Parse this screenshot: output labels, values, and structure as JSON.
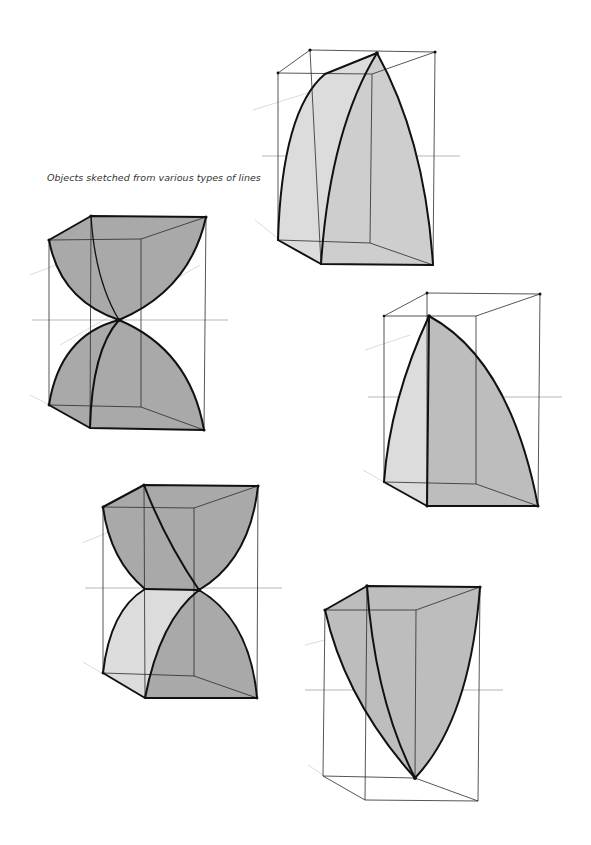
{
  "page": {
    "background": "#ffffff",
    "caption": "Objects sketched from various types of lines"
  },
  "figures": [
    {
      "id": 1,
      "label": "curved wedge with two arched faces (top center)"
    },
    {
      "id": 2,
      "label": "hourglass of two paraboloid caps meeting at a point (upper left)"
    },
    {
      "id": 3,
      "label": "quarter-arch shell with vertical edge (right)"
    },
    {
      "id": 4,
      "label": "twisted hourglass with crossing curves (lower left)"
    },
    {
      "id": 5,
      "label": "inverted curved wedge tapering to a point (lower right)"
    }
  ],
  "colors": {
    "fill_dark": "#a9a9a9",
    "fill_mid": "#bdbdbd",
    "fill_light": "#dcdcdc",
    "edge": "#111111",
    "construction_line": "#2a2a2a"
  }
}
